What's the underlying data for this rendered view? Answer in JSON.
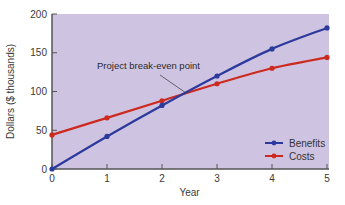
{
  "chart_data": {
    "type": "line",
    "title": "",
    "xlabel": "Year",
    "ylabel": "Dollars ($ thousands)",
    "x": [
      0,
      1,
      2,
      3,
      4,
      5
    ],
    "xlim": [
      0,
      5
    ],
    "ylim": [
      0,
      200
    ],
    "xticks": [
      "0",
      "1",
      "2",
      "3",
      "4",
      "5"
    ],
    "yticks": [
      "0",
      "50",
      "100",
      "150",
      "200"
    ],
    "grid": false,
    "legend_position": "lower right",
    "series": [
      {
        "name": "Benefits",
        "color": "#2b3a9c",
        "values": [
          0,
          42,
          82,
          120,
          155,
          182
        ]
      },
      {
        "name": "Costs",
        "color": "#cc2a1e",
        "values": [
          44,
          66,
          88,
          110,
          130,
          144
        ]
      }
    ],
    "annotations": [
      {
        "text": "Project break-even point",
        "x": 2.45,
        "y": 97
      }
    ]
  },
  "style": {
    "plot_background": "#cfc3e2",
    "axis_color": "#555555"
  }
}
